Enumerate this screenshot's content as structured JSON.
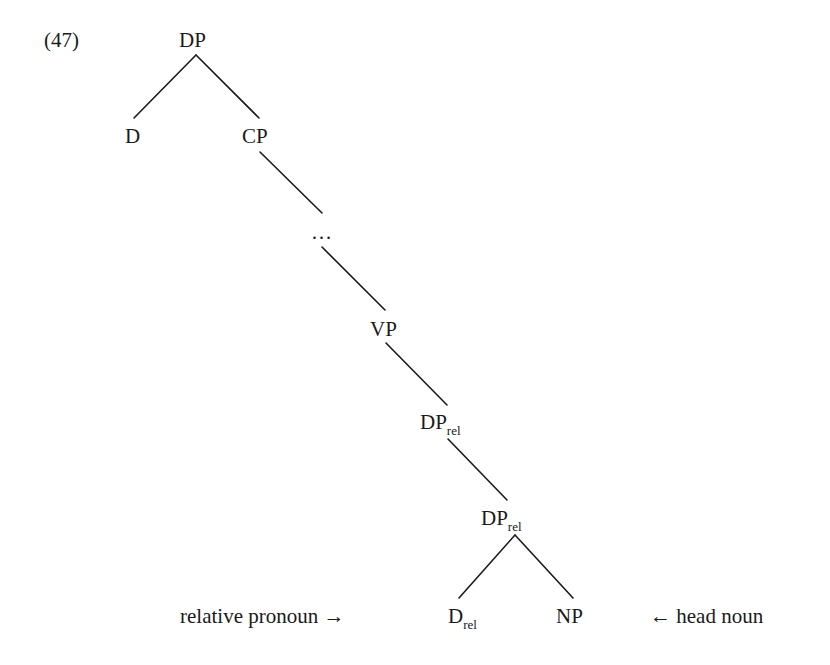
{
  "example": {
    "number": "(47)"
  },
  "tree": {
    "nodes": {
      "root": {
        "label": "DP"
      },
      "d": {
        "label": "D"
      },
      "cp": {
        "label": "CP"
      },
      "ellipsis": {
        "label": "…"
      },
      "vp": {
        "label": "VP"
      },
      "dp_rel_1": {
        "label": "DP",
        "subscript": "rel"
      },
      "dp_rel_2": {
        "label": "DP",
        "subscript": "rel"
      },
      "d_rel": {
        "label": "D",
        "subscript": "rel"
      },
      "np": {
        "label": "NP"
      }
    },
    "edges": [
      [
        "root",
        "d"
      ],
      [
        "root",
        "cp"
      ],
      [
        "cp",
        "ellipsis"
      ],
      [
        "ellipsis",
        "vp"
      ],
      [
        "vp",
        "dp_rel_1"
      ],
      [
        "dp_rel_1",
        "dp_rel_2"
      ],
      [
        "dp_rel_2",
        "d_rel"
      ],
      [
        "dp_rel_2",
        "np"
      ]
    ]
  },
  "annotations": {
    "left": "relative pronoun →",
    "right": "← head noun"
  }
}
